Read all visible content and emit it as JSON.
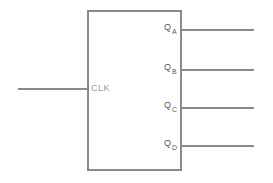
{
  "diagram": {
    "type": "block-diagram",
    "component": "counter-block",
    "colors": {
      "stroke": "#8a8a8a",
      "clk_text": "#9a9a9a",
      "output_text": "#555555",
      "background": "#ffffff"
    },
    "input": {
      "label": "CLK"
    },
    "outputs": [
      {
        "prefix": "Q",
        "sub": "A"
      },
      {
        "prefix": "Q",
        "sub": "B"
      },
      {
        "prefix": "Q",
        "sub": "C"
      },
      {
        "prefix": "Q",
        "sub": "D"
      }
    ]
  }
}
